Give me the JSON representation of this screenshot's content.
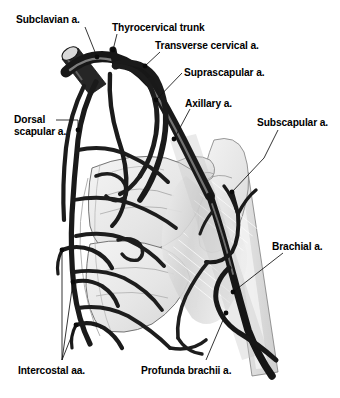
{
  "figure": {
    "background_color": "#ffffff",
    "width": 340,
    "height": 398
  },
  "palette": {
    "vessel_dark": "#1b1b1b",
    "vessel_highlight": "#8a8a8a",
    "bone_fill": "#e9e9e9",
    "bone_fill_light": "#f2f2f2",
    "bone_outline": "#5a5a5a",
    "muscle_fill": "#d8d8d8",
    "muscle_stripe": "#ffffff",
    "leader_line": "#111111",
    "label_text": "#000000"
  },
  "labels": [
    {
      "id": "subclavian",
      "text": "Subclavian a.",
      "x": 16,
      "y": 14,
      "dot": {
        "x": 97,
        "y": 57
      },
      "leader": [
        [
          85,
          27
        ],
        [
          97,
          57
        ]
      ]
    },
    {
      "id": "thyrocervical-trunk",
      "text": "Thyrocervical trunk",
      "x": 112,
      "y": 22,
      "dot": {
        "x": 113,
        "y": 50
      },
      "leader": [
        [
          117,
          34
        ],
        [
          113,
          50
        ]
      ]
    },
    {
      "id": "transverse-cervical",
      "text": "Transverse cervical a.",
      "x": 155,
      "y": 40,
      "dot": {
        "x": 145,
        "y": 66
      },
      "leader": [
        [
          160,
          52
        ],
        [
          145,
          66
        ]
      ]
    },
    {
      "id": "suprascapular",
      "text": "Suprascapular a.",
      "x": 184,
      "y": 67,
      "dot": {
        "x": 156,
        "y": 100
      },
      "leader": [
        [
          182,
          73
        ],
        [
          156,
          100
        ]
      ]
    },
    {
      "id": "axillary",
      "text": "Axillary a.",
      "x": 185,
      "y": 98,
      "dot": {
        "x": 174,
        "y": 139
      },
      "leader": [
        [
          190,
          109
        ],
        [
          174,
          139
        ]
      ]
    },
    {
      "id": "subscapular",
      "text": "Subscapular a.",
      "x": 257,
      "y": 117,
      "dot": {
        "x": 232,
        "y": 192
      },
      "leader": [
        [
          278,
          130
        ],
        [
          264,
          158
        ],
        [
          232,
          192
        ]
      ]
    },
    {
      "id": "dorsal-scapular",
      "text": "Dorsal\nscapular a.",
      "x": 14,
      "y": 114,
      "dot": {
        "x": 78,
        "y": 130
      },
      "leader": [
        [
          56,
          120
        ],
        [
          78,
          120
        ],
        [
          78,
          130
        ]
      ]
    },
    {
      "id": "brachial",
      "text": "Brachial a.",
      "x": 272,
      "y": 241,
      "dot": {
        "x": 233,
        "y": 292
      },
      "leader": [
        [
          283,
          253
        ],
        [
          233,
          292
        ]
      ]
    },
    {
      "id": "profunda-brachii",
      "text": "Profunda brachii a.",
      "x": 141,
      "y": 365,
      "dot": {
        "x": 226,
        "y": 313
      },
      "leader": [
        [
          206,
          360
        ],
        [
          226,
          313
        ]
      ]
    },
    {
      "id": "intercostal",
      "text": "Intercostal aa.",
      "x": 18,
      "y": 365,
      "dots": [
        {
          "x": 62,
          "y": 250
        },
        {
          "x": 73,
          "y": 282
        },
        {
          "x": 76,
          "y": 325
        }
      ],
      "leaders": [
        [
          [
            62,
            360
          ],
          [
            62,
            250
          ]
        ],
        [
          [
            62,
            360
          ],
          [
            73,
            282
          ]
        ],
        [
          [
            62,
            360
          ],
          [
            76,
            325
          ]
        ]
      ]
    }
  ],
  "structures": {
    "bones": [
      {
        "name": "clavicle",
        "note": "cut cylinder at upper left"
      },
      {
        "name": "scapula-body"
      },
      {
        "name": "scapula-spine"
      },
      {
        "name": "acromion"
      },
      {
        "name": "coracoid-process"
      },
      {
        "name": "humerus-shaft"
      },
      {
        "name": "ribs"
      }
    ],
    "muscle": {
      "name": "deltoid-triceps-belly",
      "note": "striated shading along humerus"
    },
    "arteries": [
      "subclavian",
      "thyrocervical-trunk",
      "transverse-cervical",
      "suprascapular",
      "dorsal-scapular",
      "axillary",
      "subscapular",
      "circumflex-scapular",
      "thoracodorsal",
      "brachial",
      "profunda-brachii",
      "intercostal"
    ]
  }
}
